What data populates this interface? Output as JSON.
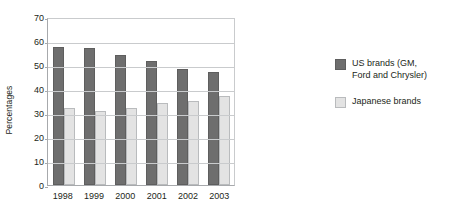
{
  "chart_data": {
    "type": "bar",
    "title": "",
    "subtitle": "",
    "xlabel": "",
    "ylabel": "Percentages",
    "ylim": [
      0,
      70
    ],
    "ytick_step": 10,
    "yticks": [
      70,
      60,
      50,
      40,
      30,
      20,
      10,
      0
    ],
    "categories": [
      "1998",
      "1999",
      "2000",
      "2001",
      "2002",
      "2003"
    ],
    "grid": "horizontal",
    "legend_position": "right",
    "series": [
      {
        "name": "US brands (GM, Ford and Chrysler)",
        "name_line1": "US brands (GM,",
        "name_line2": "Ford and Chrysler)",
        "color": "#6e6e6e",
        "values": [
          57.5,
          57,
          54,
          51.5,
          48.5,
          47
        ]
      },
      {
        "name": "Japanese brands",
        "name_line1": "Japanese brands",
        "name_line2": "",
        "color": "#e3e3e3",
        "values": [
          32,
          31,
          32,
          34,
          35,
          37
        ]
      }
    ]
  },
  "colors": {
    "us_brands": "#6e6e6e",
    "japanese_brands": "#e3e3e3",
    "gridline": "#c9cbcd",
    "axis": "#a7a9ac",
    "text": "#231f20",
    "background": "#ffffff"
  }
}
